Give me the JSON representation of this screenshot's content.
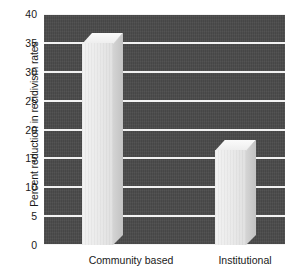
{
  "chart_data": {
    "type": "bar",
    "title": "",
    "subtitle": "",
    "xlabel": "",
    "ylabel": "Percent reduction in recidivism rates",
    "categories": [
      "Community based",
      "Institutional"
    ],
    "values": [
      35,
      16.5
    ],
    "series": [
      {
        "name": "Percent reduction in recidivism rates",
        "values": [
          35,
          16.5
        ]
      }
    ],
    "ylim": [
      0,
      40
    ],
    "ytick_values": [
      0,
      5,
      10,
      15,
      20,
      25,
      30,
      35,
      40
    ],
    "ytick_labels": [
      "0",
      "5",
      "10",
      "15",
      "20",
      "25",
      "30",
      "35",
      "40"
    ],
    "grid": true,
    "grid_axis": "y",
    "legend": false,
    "legend_position": "none",
    "annotations": [],
    "style": {
      "plot_background": "#4a4a4a",
      "gridline_color": "#f2f2f2",
      "bar_face_color": "#eaeaea",
      "bar_side_color": "#c8c8c8",
      "bar_top_color": "#f4f4f4",
      "text_color": "#1a1a1a",
      "figure_background": "#ffffff",
      "three_d": true
    }
  }
}
